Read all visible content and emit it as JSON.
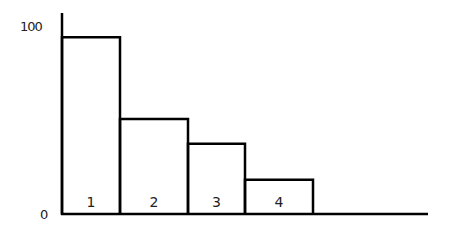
{
  "chart_data": {
    "type": "bar",
    "title": "",
    "xlabel": "",
    "ylabel": "",
    "categories": [
      "1",
      "2",
      "3",
      "4"
    ],
    "values": [
      93,
      50,
      37,
      18
    ],
    "ylim": [
      0,
      100
    ],
    "yticks": [
      "0",
      "100"
    ],
    "grid": false,
    "legend": null,
    "bar_style": "outlined, adjacent (histogram-like), labels inside bottom of bars"
  },
  "colors": {
    "stroke": "#000000",
    "background": "#ffffff",
    "text": "#222222"
  }
}
